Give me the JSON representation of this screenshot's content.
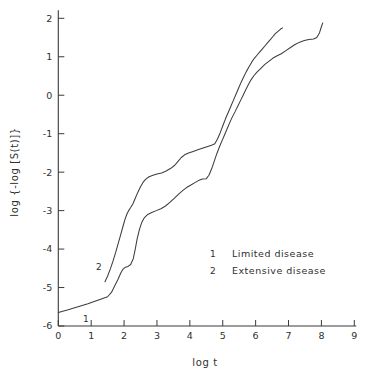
{
  "chart_data": {
    "type": "line",
    "title": "",
    "xlabel": "log t",
    "ylabel": "log {-log [S(t)]}",
    "xlim": [
      0,
      9
    ],
    "ylim": [
      -6,
      2
    ],
    "xticks": [
      "0",
      "1",
      "2",
      "3",
      "4",
      "5",
      "6",
      "7",
      "8",
      "9"
    ],
    "yticks": [
      "2",
      "1",
      "0",
      "-1",
      "-2",
      "-3",
      "-4",
      "-5",
      "-6"
    ],
    "grid": false,
    "legend_position": "middle-right",
    "legend": [
      {
        "marker": "1",
        "label": "Limited disease"
      },
      {
        "marker": "2",
        "label": "Extensive disease"
      }
    ],
    "curve_tags": [
      {
        "text": "1",
        "x": 0.75,
        "y": -5.9
      },
      {
        "text": "2",
        "x": 1.15,
        "y": -4.55
      }
    ],
    "series": [
      {
        "name": "Limited disease",
        "marker": "1",
        "color": "#3d3d3d",
        "points": [
          [
            0.0,
            -5.65
          ],
          [
            0.3,
            -5.58
          ],
          [
            0.6,
            -5.5
          ],
          [
            0.9,
            -5.42
          ],
          [
            1.2,
            -5.33
          ],
          [
            1.5,
            -5.24
          ],
          [
            1.62,
            -5.12
          ],
          [
            1.72,
            -4.95
          ],
          [
            1.82,
            -4.78
          ],
          [
            1.9,
            -4.62
          ],
          [
            1.97,
            -4.52
          ],
          [
            2.04,
            -4.47
          ],
          [
            2.12,
            -4.45
          ],
          [
            2.2,
            -4.4
          ],
          [
            2.28,
            -4.25
          ],
          [
            2.34,
            -4.0
          ],
          [
            2.4,
            -3.72
          ],
          [
            2.47,
            -3.48
          ],
          [
            2.54,
            -3.3
          ],
          [
            2.62,
            -3.18
          ],
          [
            2.72,
            -3.1
          ],
          [
            2.84,
            -3.05
          ],
          [
            2.98,
            -3.0
          ],
          [
            3.12,
            -2.95
          ],
          [
            3.26,
            -2.88
          ],
          [
            3.4,
            -2.78
          ],
          [
            3.54,
            -2.67
          ],
          [
            3.66,
            -2.57
          ],
          [
            3.78,
            -2.48
          ],
          [
            3.9,
            -2.4
          ],
          [
            4.02,
            -2.34
          ],
          [
            4.14,
            -2.28
          ],
          [
            4.26,
            -2.22
          ],
          [
            4.38,
            -2.18
          ],
          [
            4.5,
            -2.17
          ],
          [
            4.58,
            -2.08
          ],
          [
            4.66,
            -1.92
          ],
          [
            4.74,
            -1.72
          ],
          [
            4.82,
            -1.52
          ],
          [
            4.9,
            -1.34
          ],
          [
            4.98,
            -1.18
          ],
          [
            5.06,
            -1.02
          ],
          [
            5.14,
            -0.86
          ],
          [
            5.22,
            -0.7
          ],
          [
            5.3,
            -0.55
          ],
          [
            5.38,
            -0.42
          ],
          [
            5.46,
            -0.28
          ],
          [
            5.54,
            -0.14
          ],
          [
            5.62,
            0.0
          ],
          [
            5.7,
            0.14
          ],
          [
            5.78,
            0.28
          ],
          [
            5.86,
            0.4
          ],
          [
            5.94,
            0.5
          ],
          [
            6.04,
            0.6
          ],
          [
            6.16,
            0.7
          ],
          [
            6.28,
            0.8
          ],
          [
            6.4,
            0.88
          ],
          [
            6.52,
            0.96
          ],
          [
            6.64,
            1.02
          ],
          [
            6.78,
            1.08
          ],
          [
            6.92,
            1.16
          ],
          [
            7.06,
            1.24
          ],
          [
            7.2,
            1.32
          ],
          [
            7.34,
            1.38
          ],
          [
            7.48,
            1.42
          ],
          [
            7.62,
            1.45
          ],
          [
            7.76,
            1.46
          ],
          [
            7.86,
            1.5
          ],
          [
            7.94,
            1.62
          ],
          [
            8.0,
            1.78
          ],
          [
            8.04,
            1.88
          ]
        ]
      },
      {
        "name": "Extensive disease",
        "marker": "2",
        "color": "#3d3d3d",
        "points": [
          [
            1.42,
            -4.85
          ],
          [
            1.5,
            -4.7
          ],
          [
            1.58,
            -4.52
          ],
          [
            1.66,
            -4.32
          ],
          [
            1.74,
            -4.1
          ],
          [
            1.82,
            -3.86
          ],
          [
            1.9,
            -3.62
          ],
          [
            1.97,
            -3.4
          ],
          [
            2.03,
            -3.22
          ],
          [
            2.08,
            -3.1
          ],
          [
            2.14,
            -3.0
          ],
          [
            2.2,
            -2.92
          ],
          [
            2.27,
            -2.82
          ],
          [
            2.34,
            -2.68
          ],
          [
            2.42,
            -2.52
          ],
          [
            2.5,
            -2.38
          ],
          [
            2.58,
            -2.26
          ],
          [
            2.66,
            -2.18
          ],
          [
            2.76,
            -2.12
          ],
          [
            2.88,
            -2.08
          ],
          [
            3.0,
            -2.05
          ],
          [
            3.14,
            -2.02
          ],
          [
            3.28,
            -1.97
          ],
          [
            3.42,
            -1.9
          ],
          [
            3.54,
            -1.82
          ],
          [
            3.64,
            -1.72
          ],
          [
            3.74,
            -1.62
          ],
          [
            3.84,
            -1.55
          ],
          [
            3.96,
            -1.5
          ],
          [
            4.1,
            -1.46
          ],
          [
            4.24,
            -1.42
          ],
          [
            4.38,
            -1.38
          ],
          [
            4.52,
            -1.34
          ],
          [
            4.66,
            -1.3
          ],
          [
            4.76,
            -1.26
          ],
          [
            4.84,
            -1.14
          ],
          [
            4.92,
            -0.98
          ],
          [
            5.0,
            -0.8
          ],
          [
            5.08,
            -0.62
          ],
          [
            5.16,
            -0.46
          ],
          [
            5.24,
            -0.3
          ],
          [
            5.32,
            -0.14
          ],
          [
            5.4,
            0.02
          ],
          [
            5.48,
            0.18
          ],
          [
            5.56,
            0.34
          ],
          [
            5.64,
            0.48
          ],
          [
            5.72,
            0.62
          ],
          [
            5.8,
            0.74
          ],
          [
            5.88,
            0.86
          ],
          [
            5.96,
            0.96
          ],
          [
            6.04,
            1.04
          ],
          [
            6.12,
            1.12
          ],
          [
            6.2,
            1.2
          ],
          [
            6.28,
            1.28
          ],
          [
            6.36,
            1.36
          ],
          [
            6.44,
            1.44
          ],
          [
            6.52,
            1.52
          ],
          [
            6.6,
            1.6
          ],
          [
            6.68,
            1.66
          ],
          [
            6.76,
            1.72
          ],
          [
            6.82,
            1.75
          ]
        ]
      }
    ]
  }
}
